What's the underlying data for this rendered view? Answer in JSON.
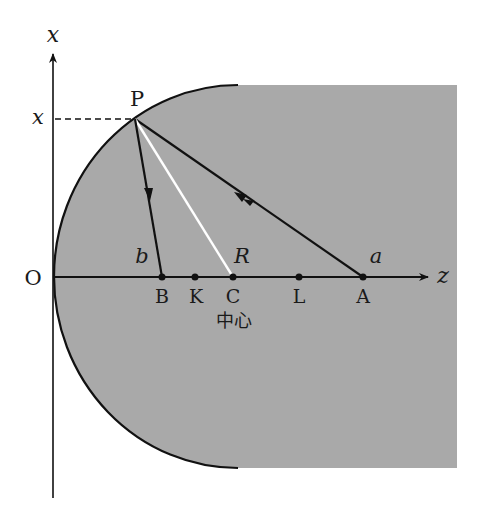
{
  "diagram": {
    "colors": {
      "medium_fill": "#a9a9a9",
      "line": "#111111",
      "center_ray": "#ffffff",
      "background": "#ffffff"
    },
    "axes": {
      "vertical_label": "x",
      "horizontal_label": "z",
      "origin_label": "O"
    },
    "point_P": {
      "label": "P",
      "height_label": "x"
    },
    "axis_points": [
      {
        "id": "B",
        "label": "B"
      },
      {
        "id": "K",
        "label": "K"
      },
      {
        "id": "C",
        "label": "C"
      },
      {
        "id": "L",
        "label": "L"
      },
      {
        "id": "A",
        "label": "A"
      }
    ],
    "annotations": {
      "b": "b",
      "R": "R",
      "a": "a",
      "center_caption": "中心"
    }
  }
}
